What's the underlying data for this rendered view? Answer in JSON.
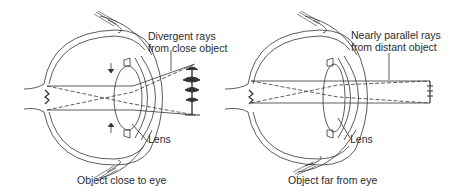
{
  "figure": {
    "panels": [
      {
        "id": "near",
        "rays_label_line1": "Divergent rays",
        "rays_label_line2": "from close object",
        "lens_label": "Lens",
        "caption": "Object close to eye",
        "object": "tree"
      },
      {
        "id": "far",
        "rays_label_line1": "Nearly parallel rays",
        "rays_label_line2": "from distant object",
        "lens_label": "Lens",
        "caption": "Object far from eye",
        "object": "distant tree"
      }
    ],
    "colors": {
      "line": "#333333",
      "text": "#2a2a2a",
      "background": "#ffffff"
    }
  }
}
